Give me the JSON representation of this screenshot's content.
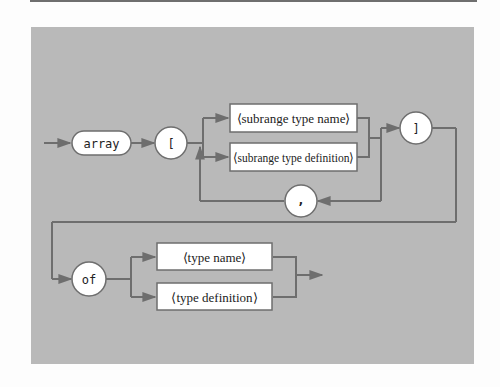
{
  "diagram": {
    "type": "syntax-diagram",
    "colors": {
      "panel": "#b9b9b9",
      "line": "#6e6e6e",
      "box_fill": "#ffffff",
      "box_stroke": "#6e6e6e",
      "text": "#222222"
    },
    "terminals": {
      "array": "array",
      "open_bracket": "[",
      "close_bracket": "]",
      "comma": ",",
      "of": "of"
    },
    "nonterminals": {
      "subrange_type_name": "⟨subrange type name⟩",
      "subrange_type_definition": "⟨subrange type definition⟩",
      "type_name": "⟨type name⟩",
      "type_definition": "⟨type definition⟩"
    }
  }
}
